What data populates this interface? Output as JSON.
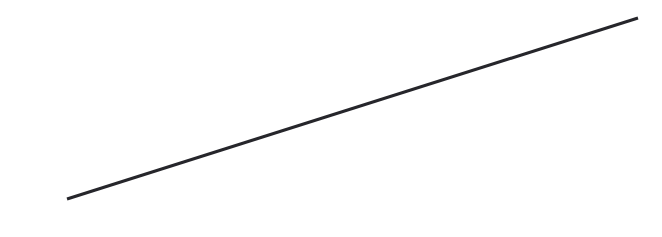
{
  "figure": {
    "kind": "line-drawing",
    "title": "",
    "width": 662,
    "height": 237,
    "background_color": "#ffffff"
  },
  "chart_data": {
    "type": "line",
    "title": "",
    "subtitle": "",
    "xlabel": "",
    "ylabel": "",
    "grid": false,
    "legend": null,
    "axes_visible": false,
    "tick_labels": {
      "x": [],
      "y": []
    },
    "xlim": [
      0,
      662
    ],
    "ylim": [
      0,
      237
    ],
    "annotations": [],
    "series": [
      {
        "name": "line-1",
        "color": "#26262b",
        "stroke_width": 3,
        "line_cap": "butt",
        "x": [
          67,
          638
        ],
        "y": [
          199,
          18
        ],
        "points": [
          {
            "x": 67,
            "y": 199
          },
          {
            "x": 638,
            "y": 18
          }
        ],
        "slope": -0.317,
        "angle_degrees": -17.6,
        "length_px": 599
      }
    ]
  }
}
